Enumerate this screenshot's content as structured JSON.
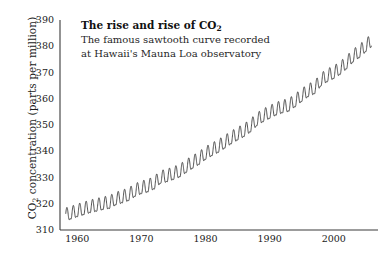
{
  "chart_data": {
    "type": "line",
    "title": "The rise and rise of CO2",
    "title_prefix": "The rise and rise of CO",
    "title_sub": "2",
    "subtitle_lines": [
      "The famous sawtooth curve recorded",
      "at Hawaii's Mauna Loa observatory"
    ],
    "xlabel": "",
    "ylabel_prefix": "CO",
    "ylabel_sub": "2",
    "ylabel_suffix": " concentration (parts per million)",
    "ylabel": "CO2 concentration (parts per million)",
    "xlim": [
      1957.3,
      2006.9
    ],
    "ylim": [
      310,
      390
    ],
    "yticks": [
      310,
      320,
      330,
      340,
      350,
      360,
      370,
      380,
      390
    ],
    "xticks": [
      1960,
      1970,
      1980,
      1990,
      2000
    ],
    "grid": false,
    "legend": "none",
    "series": [
      {
        "name": "Mauna Loa monthly mean CO2",
        "color": "#262626",
        "line_width": 0.8,
        "seasonal_amplitude": 3.1,
        "seasonal_peak_month": 5,
        "annual_trend": [
          {
            "year": 1958,
            "value": 315.3
          },
          {
            "year": 1959,
            "value": 315.98
          },
          {
            "year": 1960,
            "value": 316.91
          },
          {
            "year": 1961,
            "value": 317.64
          },
          {
            "year": 1962,
            "value": 318.45
          },
          {
            "year": 1963,
            "value": 318.99
          },
          {
            "year": 1964,
            "value": 319.62
          },
          {
            "year": 1965,
            "value": 320.04
          },
          {
            "year": 1966,
            "value": 321.38
          },
          {
            "year": 1967,
            "value": 322.16
          },
          {
            "year": 1968,
            "value": 323.04
          },
          {
            "year": 1969,
            "value": 324.62
          },
          {
            "year": 1970,
            "value": 325.68
          },
          {
            "year": 1971,
            "value": 326.32
          },
          {
            "year": 1972,
            "value": 327.45
          },
          {
            "year": 1973,
            "value": 329.68
          },
          {
            "year": 1974,
            "value": 330.18
          },
          {
            "year": 1975,
            "value": 331.11
          },
          {
            "year": 1976,
            "value": 332.04
          },
          {
            "year": 1977,
            "value": 333.83
          },
          {
            "year": 1978,
            "value": 335.4
          },
          {
            "year": 1979,
            "value": 336.84
          },
          {
            "year": 1980,
            "value": 338.75
          },
          {
            "year": 1981,
            "value": 340.11
          },
          {
            "year": 1982,
            "value": 341.45
          },
          {
            "year": 1983,
            "value": 343.05
          },
          {
            "year": 1984,
            "value": 344.65
          },
          {
            "year": 1985,
            "value": 346.12
          },
          {
            "year": 1986,
            "value": 347.42
          },
          {
            "year": 1987,
            "value": 349.19
          },
          {
            "year": 1988,
            "value": 351.57
          },
          {
            "year": 1989,
            "value": 353.12
          },
          {
            "year": 1990,
            "value": 354.39
          },
          {
            "year": 1991,
            "value": 355.61
          },
          {
            "year": 1992,
            "value": 356.45
          },
          {
            "year": 1993,
            "value": 357.1
          },
          {
            "year": 1994,
            "value": 358.83
          },
          {
            "year": 1995,
            "value": 360.82
          },
          {
            "year": 1996,
            "value": 362.61
          },
          {
            "year": 1997,
            "value": 363.73
          },
          {
            "year": 1998,
            "value": 366.7
          },
          {
            "year": 1999,
            "value": 368.38
          },
          {
            "year": 2000,
            "value": 369.55
          },
          {
            "year": 2001,
            "value": 371.14
          },
          {
            "year": 2002,
            "value": 373.28
          },
          {
            "year": 2003,
            "value": 375.8
          },
          {
            "year": 2004,
            "value": 377.52
          },
          {
            "year": 2005,
            "value": 379.8
          },
          {
            "year": 2006,
            "value": 381.9
          }
        ]
      }
    ],
    "axis": {
      "color": "#3a3a3a",
      "width": 1.1,
      "spines": [
        "left",
        "bottom"
      ]
    },
    "plot_area": {
      "left": 60,
      "top": 20,
      "right": 378,
      "bottom": 230
    }
  }
}
